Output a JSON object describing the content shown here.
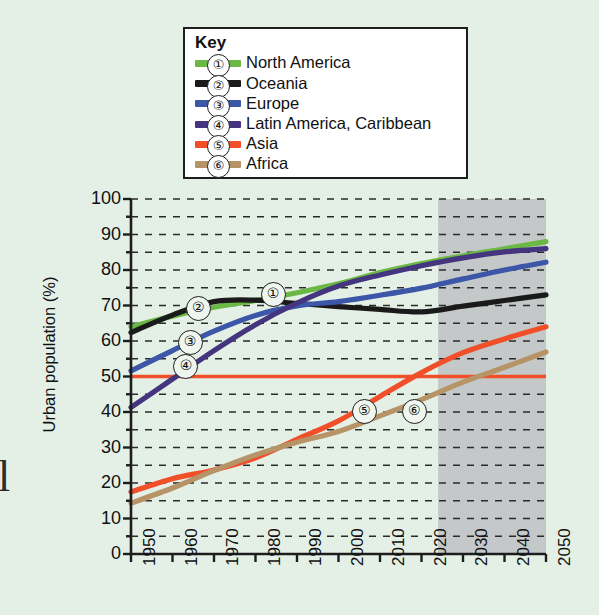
{
  "page_bleed_text": "l",
  "legend": {
    "title": "Key",
    "entries": [
      {
        "num": "①",
        "label": "North America",
        "color": "#6cb845"
      },
      {
        "num": "②",
        "label": "Oceania",
        "color": "#1a1a1a"
      },
      {
        "num": "③",
        "label": "Europe",
        "color": "#3c57a8"
      },
      {
        "num": "④",
        "label": "Latin America, Caribbean",
        "color": "#44357e"
      },
      {
        "num": "⑤",
        "label": "Asia",
        "color": "#f04f2a"
      },
      {
        "num": "⑥",
        "label": "Africa",
        "color": "#b79468"
      }
    ]
  },
  "chart_data": {
    "type": "line",
    "title": "",
    "xlabel": "",
    "ylabel": "Urban population (%)",
    "xlim": [
      1950,
      2050
    ],
    "ylim": [
      0,
      100
    ],
    "ytick_step": 10,
    "yminor_step": 5,
    "xtick_step": 10,
    "grid": "horizontal-dashed",
    "legend_position": "top-center-box",
    "projection_shading": {
      "from": 2024,
      "to": 2050,
      "color": "#b0b0b4",
      "label": ""
    },
    "ytick_labels": [
      "0",
      "10",
      "20",
      "30",
      "40",
      "50",
      "60",
      "70",
      "80",
      "90",
      "100"
    ],
    "xtick_labels": [
      "1950",
      "1960",
      "1970",
      "1980",
      "1990",
      "2000",
      "2010",
      "2020",
      "2030",
      "2040",
      "2050"
    ],
    "x": [
      1950,
      1960,
      1970,
      1980,
      1990,
      2000,
      2010,
      2020,
      2030,
      2040,
      2050
    ],
    "series": [
      {
        "name": "North America",
        "num": "①",
        "color": "#6cb845",
        "values": [
          64.0,
          67.0,
          69.5,
          71.4,
          73.6,
          76.1,
          79.3,
          81.8,
          84.0,
          86.0,
          88.0
        ],
        "marker_at": {
          "x": 1984,
          "y": 73.5
        }
      },
      {
        "name": "Oceania",
        "num": "②",
        "color": "#1a1a1a",
        "values": [
          62.4,
          67.3,
          71.1,
          71.5,
          70.6,
          69.7,
          68.9,
          68.2,
          69.8,
          71.4,
          73.0
        ],
        "marker_at": {
          "x": 1966,
          "y": 69.5
        }
      },
      {
        "name": "Europe",
        "num": "③",
        "color": "#3c57a8",
        "values": [
          51.6,
          57.3,
          62.8,
          67.2,
          69.9,
          71.1,
          72.9,
          74.9,
          77.5,
          80.0,
          82.2
        ],
        "marker_at": {
          "x": 1964,
          "y": 60.0
        }
      },
      {
        "name": "Latin America, Caribbean",
        "num": "④",
        "color": "#44357e",
        "values": [
          41.3,
          49.3,
          57.3,
          64.6,
          70.7,
          75.5,
          78.6,
          81.2,
          83.4,
          85.1,
          86.0
        ],
        "marker_at": {
          "x": 1963,
          "y": 53.0
        }
      },
      {
        "name": "Asia",
        "num": "⑤",
        "color": "#f04f2a",
        "values": [
          17.5,
          21.2,
          23.7,
          27.1,
          32.3,
          37.5,
          44.4,
          51.1,
          56.7,
          60.6,
          64.0
        ],
        "marker_at": {
          "x": 2006,
          "y": 40.5
        }
      },
      {
        "name": "Africa",
        "num": "⑥",
        "color": "#b79468",
        "values": [
          14.3,
          18.6,
          23.5,
          27.9,
          31.5,
          34.5,
          38.9,
          43.5,
          48.4,
          52.6,
          56.9
        ],
        "marker_at": {
          "x": 2018,
          "y": 40.5
        }
      }
    ],
    "reference_line": {
      "name": "50% reference",
      "value": 50,
      "color": "#f04f2a"
    }
  }
}
